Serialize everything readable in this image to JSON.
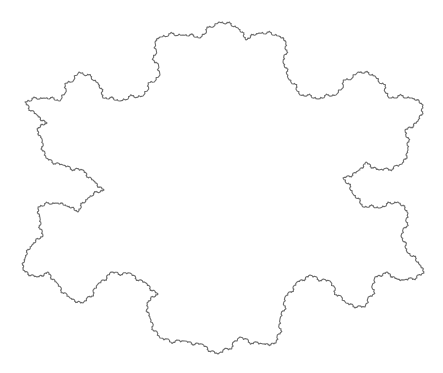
{
  "figure": {
    "type": "fractal-outline",
    "stroke_color": "#6b6b6b",
    "background": "#ffffff",
    "detail_depth": 2,
    "vertices": [
      [
        25,
        102
      ],
      [
        44,
        98
      ],
      [
        60,
        101
      ],
      [
        79,
        72
      ],
      [
        98,
        83
      ],
      [
        103,
        98
      ],
      [
        120,
        101
      ],
      [
        143,
        96
      ],
      [
        160,
        75
      ],
      [
        155,
        42
      ],
      [
        160,
        37
      ],
      [
        183,
        35
      ],
      [
        200,
        38
      ],
      [
        219,
        22
      ],
      [
        238,
        28
      ],
      [
        246,
        40
      ],
      [
        259,
        33
      ],
      [
        279,
        36
      ],
      [
        286,
        42
      ],
      [
        283,
        62
      ],
      [
        288,
        78
      ],
      [
        300,
        95
      ],
      [
        318,
        99
      ],
      [
        336,
        95
      ],
      [
        358,
        72
      ],
      [
        375,
        76
      ],
      [
        389,
        98
      ],
      [
        412,
        98
      ],
      [
        423,
        105
      ],
      [
        418,
        121
      ],
      [
        405,
        130
      ],
      [
        408,
        150
      ],
      [
        402,
        164
      ],
      [
        379,
        170
      ],
      [
        366,
        162
      ],
      [
        358,
        171
      ],
      [
        343,
        178
      ],
      [
        353,
        194
      ],
      [
        363,
        207
      ],
      [
        380,
        208
      ],
      [
        398,
        202
      ],
      [
        408,
        213
      ],
      [
        401,
        236
      ],
      [
        407,
        252
      ],
      [
        420,
        265
      ],
      [
        424,
        273
      ],
      [
        404,
        280
      ],
      [
        397,
        279
      ],
      [
        387,
        272
      ],
      [
        375,
        277
      ],
      [
        365,
        307
      ],
      [
        346,
        303
      ],
      [
        330,
        281
      ],
      [
        310,
        275
      ],
      [
        297,
        282
      ],
      [
        285,
        297
      ],
      [
        280,
        319
      ],
      [
        276,
        343
      ],
      [
        263,
        344
      ],
      [
        240,
        337
      ],
      [
        218,
        354
      ],
      [
        202,
        344
      ],
      [
        185,
        341
      ],
      [
        160,
        338
      ],
      [
        150,
        318
      ],
      [
        147,
        303
      ],
      [
        158,
        294
      ],
      [
        146,
        283
      ],
      [
        130,
        273
      ],
      [
        111,
        272
      ],
      [
        98,
        284
      ],
      [
        83,
        303
      ],
      [
        70,
        298
      ],
      [
        57,
        283
      ],
      [
        48,
        272
      ],
      [
        37,
        277
      ],
      [
        23,
        270
      ],
      [
        25,
        258
      ],
      [
        32,
        245
      ],
      [
        43,
        236
      ],
      [
        40,
        218
      ],
      [
        38,
        207
      ],
      [
        56,
        203
      ],
      [
        67,
        206
      ],
      [
        78,
        212
      ],
      [
        88,
        198
      ],
      [
        104,
        190
      ],
      [
        94,
        181
      ],
      [
        83,
        170
      ],
      [
        63,
        165
      ],
      [
        46,
        158
      ],
      [
        42,
        139
      ],
      [
        37,
        129
      ],
      [
        47,
        123
      ],
      [
        37,
        115
      ]
    ]
  }
}
